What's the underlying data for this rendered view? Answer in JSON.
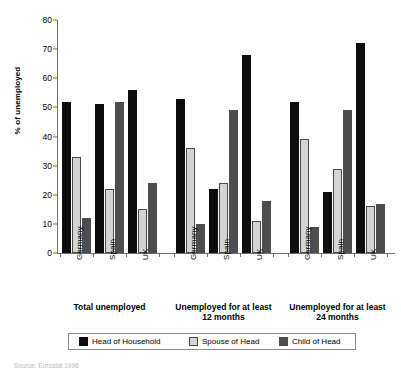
{
  "chart_data": {
    "type": "bar",
    "title": "",
    "xlabel": "",
    "ylabel": "% of unemployed",
    "ylim": [
      0,
      80
    ],
    "ytick_step": 10,
    "yticks": [
      0,
      10,
      20,
      30,
      40,
      50,
      60,
      70,
      80
    ],
    "grid": false,
    "legend_position": "bottom",
    "categories": [
      "Germany",
      "Spain",
      "UK"
    ],
    "groups": [
      {
        "label": "Total unemployed",
        "categories": [
          "Germany",
          "Spain",
          "UK"
        ],
        "series": [
          {
            "name": "Head of Household",
            "values": [
              52,
              51,
              56
            ]
          },
          {
            "name": "Spouse of Head",
            "values": [
              33,
              22,
              15
            ]
          },
          {
            "name": "Child of Head",
            "values": [
              12,
              52,
              24
            ]
          }
        ]
      },
      {
        "label": "Unemployed for at least\n12 months",
        "categories": [
          "Germany",
          "Spain",
          "UK"
        ],
        "series": [
          {
            "name": "Head of Household",
            "values": [
              53,
              22,
              68
            ]
          },
          {
            "name": "Spouse of Head",
            "values": [
              36,
              24,
              11
            ]
          },
          {
            "name": "Child of Head",
            "values": [
              10,
              49,
              18
            ]
          }
        ]
      },
      {
        "label": "Unemployed for at least\n24 months",
        "categories": [
          "Germany",
          "Spain",
          "UK"
        ],
        "series": [
          {
            "name": "Head of Household",
            "values": [
              52,
              21,
              72
            ]
          },
          {
            "name": "Spouse of Head",
            "values": [
              39,
              29,
              16
            ]
          },
          {
            "name": "Child of Head",
            "values": [
              9,
              49,
              17
            ]
          }
        ]
      }
    ],
    "series_colors": [
      "#0d0d0d",
      "#d4d4d4",
      "#4d4d4d"
    ]
  },
  "legend": {
    "items": [
      {
        "label": "Head of Household",
        "color": "#0d0d0d"
      },
      {
        "label": "Spouse of Head",
        "color": "#d4d4d4"
      },
      {
        "label": "Child of Head",
        "color": "#4d4d4d"
      }
    ]
  },
  "source_note": "Source: Eurostat 1996"
}
